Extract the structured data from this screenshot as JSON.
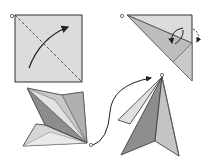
{
  "diagram": {
    "type": "origami-instructions",
    "steps": [
      {
        "index": 1,
        "description": "square with diagonal valley fold line and fold arrow"
      },
      {
        "index": 2,
        "description": "triangle folded with flap fold arrows"
      },
      {
        "index": 3,
        "description": "multi-layer folded shape"
      },
      {
        "index": 4,
        "description": "finished pointed form"
      }
    ],
    "colors": {
      "paper_light": "#e4e4e4",
      "paper_mid": "#c8c8c8",
      "paper_dark": "#9a9a9a",
      "paper_darker": "#7c7c7c",
      "outline": "#2a2a2a",
      "background": "#ffffff"
    }
  }
}
